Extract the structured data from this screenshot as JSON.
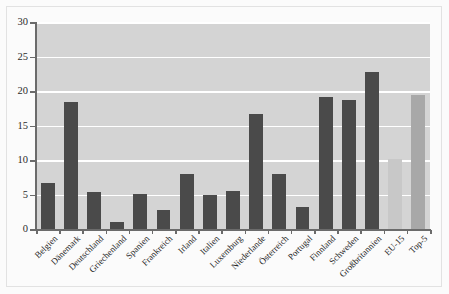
{
  "chart_data": {
    "type": "bar",
    "title": "",
    "subtitle": "",
    "xlabel": "",
    "ylabel": "",
    "ylim": [
      0,
      30
    ],
    "yticks": [
      0,
      5,
      10,
      15,
      20,
      25,
      30
    ],
    "ytick_labels": [
      "0",
      "5",
      "10",
      "15",
      "20",
      "25",
      "30"
    ],
    "grid": true,
    "legend": "none",
    "categories": [
      "Belgien",
      "Dänemark",
      "Deutschland",
      "Griechenland",
      "Spanien",
      "Frankreich",
      "Irland",
      "Italien",
      "Luxemburg",
      "Niederlande",
      "Österreich",
      "Portugal",
      "Finnland",
      "Schweden",
      "Großbritannien",
      "EU-15",
      "Top-5"
    ],
    "values": [
      6.6,
      18.4,
      5.3,
      1.0,
      5.1,
      2.8,
      7.9,
      4.9,
      5.5,
      16.6,
      7.9,
      3.2,
      19.2,
      18.7,
      22.7,
      10.2,
      19.4
    ],
    "bar_colors": [
      "#4a4a4a",
      "#4a4a4a",
      "#4a4a4a",
      "#4a4a4a",
      "#4a4a4a",
      "#4a4a4a",
      "#4a4a4a",
      "#4a4a4a",
      "#4a4a4a",
      "#4a4a4a",
      "#4a4a4a",
      "#4a4a4a",
      "#4a4a4a",
      "#4a4a4a",
      "#4a4a4a",
      "#c8c8c8",
      "#a8a8a8"
    ]
  },
  "style": {
    "plot_background": "#d4d4d4",
    "page_background": "#fbfbfb",
    "gridline_color": "#ffffff",
    "axis_color": "#6b6b6b",
    "country_bar_color": "#4a4a4a",
    "eu15_bar_color": "#c8c8c8",
    "top5_bar_color": "#a8a8a8"
  }
}
